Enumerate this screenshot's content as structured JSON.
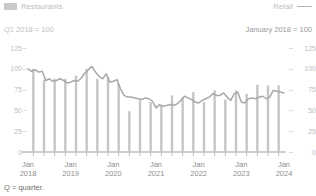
{
  "legend": {
    "bar_series_label": "Restaurants",
    "line_series_label": "Retail",
    "bar_icon": "bar-swatch-icon",
    "line_icon": "line-swatch-icon"
  },
  "subtitles": {
    "left": "Q1 2018 = 100",
    "right": "January 2018 = 100"
  },
  "footnote": "Q = quarter.",
  "axes": {
    "left_ticks": [
      "125",
      "100",
      "75",
      "50",
      "25",
      "0"
    ],
    "right_ticks": [
      "125",
      "100",
      "75",
      "50",
      "25",
      "0"
    ],
    "x_labels": [
      {
        "month": "Jan",
        "year": "2018"
      },
      {
        "month": "Jan",
        "year": "2019"
      },
      {
        "month": "Jan",
        "year": "2020"
      },
      {
        "month": "Jan",
        "year": "2021"
      },
      {
        "month": "Jan",
        "year": "2022"
      },
      {
        "month": "Jan",
        "year": "2023"
      },
      {
        "month": "Jan",
        "year": "2024"
      }
    ]
  },
  "colors": {
    "bar": "#c6c6c6",
    "line": "#a8a8a8",
    "axis_text": "#bdbdbd",
    "x_text": "#8e8e8e",
    "baseline": "#bfbfbf",
    "background": "#ffffff"
  },
  "chart_data": {
    "type": "bar",
    "title": "",
    "subtitle": "Q1 2018 = 100 / January 2018 = 100",
    "xlabel": "",
    "ylabel": "",
    "ylim": [
      0,
      137
    ],
    "grid": false,
    "legend_position": "top",
    "y_ticks": [
      0,
      25,
      50,
      75,
      100,
      125
    ],
    "series": [
      {
        "name": "Restaurants",
        "type": "bar",
        "unit": "Q1 2018 = 100",
        "categories": [
          "Q1 2018",
          "Q2 2018",
          "Q3 2018",
          "Q4 2018",
          "Q1 2019",
          "Q2 2019",
          "Q3 2019",
          "Q4 2019",
          "Q1 2020",
          "Q2 2020",
          "Q3 2020",
          "Q4 2020",
          "Q1 2021",
          "Q2 2021",
          "Q3 2021",
          "Q4 2021",
          "Q1 2022",
          "Q2 2022",
          "Q3 2022",
          "Q4 2022",
          "Q1 2023",
          "Q2 2023",
          "Q3 2023",
          "Q4 2023"
        ],
        "values": [
          100,
          87,
          88,
          88,
          92,
          100,
          88,
          90,
          82,
          49,
          62,
          60,
          56,
          68,
          66,
          72,
          60,
          74,
          63,
          74,
          70,
          81,
          80,
          80
        ]
      },
      {
        "name": "Retail",
        "type": "line",
        "unit": "January 2018 = 100",
        "x": [
          "Jan 2018",
          "Feb 2018",
          "Mar 2018",
          "Apr 2018",
          "May 2018",
          "Jun 2018",
          "Jul 2018",
          "Aug 2018",
          "Sep 2018",
          "Oct 2018",
          "Nov 2018",
          "Dec 2018",
          "Jan 2019",
          "Feb 2019",
          "Mar 2019",
          "Apr 2019",
          "May 2019",
          "Jun 2019",
          "Jul 2019",
          "Aug 2019",
          "Sep 2019",
          "Oct 2019",
          "Nov 2019",
          "Dec 2019",
          "Jan 2020",
          "Feb 2020",
          "Mar 2020",
          "Apr 2020",
          "May 2020",
          "Jun 2020",
          "Jul 2020",
          "Aug 2020",
          "Sep 2020",
          "Oct 2020",
          "Nov 2020",
          "Dec 2020",
          "Jan 2021",
          "Feb 2021",
          "Mar 2021",
          "Apr 2021",
          "May 2021",
          "Jun 2021",
          "Jul 2021",
          "Aug 2021",
          "Sep 2021",
          "Oct 2021",
          "Nov 2021",
          "Dec 2021",
          "Jan 2022",
          "Feb 2022",
          "Mar 2022",
          "Apr 2022",
          "May 2022",
          "Jun 2022",
          "Jul 2022",
          "Aug 2022",
          "Sep 2022",
          "Oct 2022",
          "Nov 2022",
          "Dec 2022",
          "Jan 2023",
          "Feb 2023",
          "Mar 2023",
          "Apr 2023",
          "May 2023",
          "Jun 2023",
          "Jul 2023",
          "Aug 2023",
          "Sep 2023",
          "Oct 2023",
          "Nov 2023",
          "Dec 2023",
          "Jan 2024"
        ],
        "values": [
          100,
          97,
          99,
          96,
          97,
          86,
          88,
          85,
          86,
          88,
          86,
          83,
          84,
          86,
          85,
          89,
          95,
          99,
          103,
          96,
          91,
          88,
          94,
          84,
          85,
          87,
          76,
          68,
          66,
          66,
          65,
          64,
          63,
          65,
          64,
          61,
          53,
          57,
          55,
          56,
          57,
          56,
          58,
          62,
          67,
          65,
          63,
          60,
          59,
          62,
          64,
          66,
          70,
          68,
          68,
          71,
          66,
          62,
          70,
          72,
          60,
          59,
          64,
          65,
          64,
          66,
          67,
          64,
          66,
          74,
          73,
          72,
          71
        ]
      }
    ]
  }
}
